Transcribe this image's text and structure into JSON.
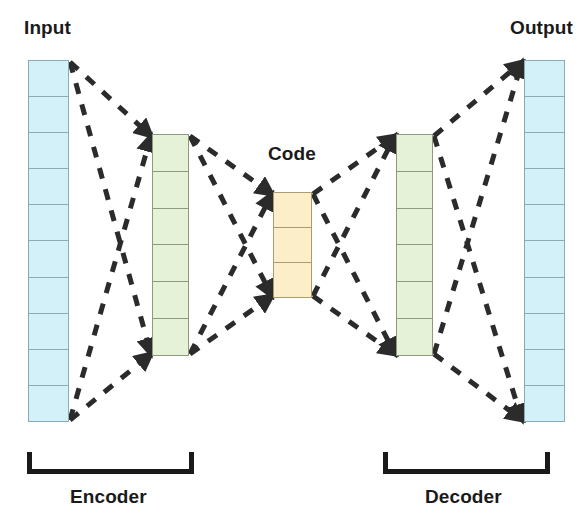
{
  "diagram": {
    "title_alt": "Autoencoder architecture",
    "background_color": "#ffffff"
  },
  "labels": {
    "input": "Input",
    "output": "Output",
    "code": "Code",
    "encoder": "Encoder",
    "decoder": "Decoder"
  },
  "colors": {
    "input_fill": "#d3f1f9",
    "output_fill": "#d3f1f9",
    "hidden_fill": "#e5f2d8",
    "code_fill": "#fbeec9",
    "cell_stroke": "#8f9a9c",
    "connection_stroke": "#2b2b2b",
    "bracket_stroke": "#1a1a1a",
    "text": "#1a1a1a"
  },
  "layers": [
    {
      "id": "input",
      "name": "Input",
      "units": 10,
      "fill": "#d3f1f9",
      "x": 28,
      "y": 60,
      "width": 41,
      "height": 362
    },
    {
      "id": "encoder-hidden",
      "name": "Encoder hidden layer",
      "units": 6,
      "fill": "#e5f2d8",
      "x": 152,
      "y": 134,
      "width": 37,
      "height": 222
    },
    {
      "id": "code",
      "name": "Code",
      "units": 3,
      "fill": "#fbeec9",
      "x": 273,
      "y": 192,
      "width": 39,
      "height": 106
    },
    {
      "id": "decoder-hidden",
      "name": "Decoder hidden layer",
      "units": 6,
      "fill": "#e5f2d8",
      "x": 396,
      "y": 134,
      "width": 37,
      "height": 222
    },
    {
      "id": "output",
      "name": "Output",
      "units": 10,
      "fill": "#d3f1f9",
      "x": 524,
      "y": 60,
      "width": 41,
      "height": 362
    }
  ],
  "connections": {
    "style": "dashed-arrow",
    "dash_pattern": "11 11",
    "stroke_width": 5,
    "edges": [
      {
        "from": "input-top",
        "to": "encoder-top",
        "x1": 70,
        "y1": 62,
        "x2": 151,
        "y2": 136
      },
      {
        "from": "input-top",
        "to": "encoder-bottom",
        "x1": 70,
        "y1": 62,
        "x2": 151,
        "y2": 354
      },
      {
        "from": "input-bottom",
        "to": "encoder-top",
        "x1": 70,
        "y1": 420,
        "x2": 151,
        "y2": 136
      },
      {
        "from": "input-bottom",
        "to": "encoder-bottom",
        "x1": 70,
        "y1": 420,
        "x2": 151,
        "y2": 354
      },
      {
        "from": "encoder-top",
        "to": "code-top",
        "x1": 190,
        "y1": 136,
        "x2": 272,
        "y2": 194
      },
      {
        "from": "encoder-top",
        "to": "code-bottom",
        "x1": 190,
        "y1": 136,
        "x2": 272,
        "y2": 296
      },
      {
        "from": "encoder-bottom",
        "to": "code-top",
        "x1": 190,
        "y1": 354,
        "x2": 272,
        "y2": 194
      },
      {
        "from": "encoder-bottom",
        "to": "code-bottom",
        "x1": 190,
        "y1": 354,
        "x2": 272,
        "y2": 296
      },
      {
        "from": "code-top",
        "to": "decoder-top",
        "x1": 313,
        "y1": 194,
        "x2": 395,
        "y2": 136
      },
      {
        "from": "code-top",
        "to": "decoder-bottom",
        "x1": 313,
        "y1": 194,
        "x2": 395,
        "y2": 354
      },
      {
        "from": "code-bottom",
        "to": "decoder-top",
        "x1": 313,
        "y1": 296,
        "x2": 395,
        "y2": 136
      },
      {
        "from": "code-bottom",
        "to": "decoder-bottom",
        "x1": 313,
        "y1": 296,
        "x2": 395,
        "y2": 354
      },
      {
        "from": "decoder-top",
        "to": "output-top",
        "x1": 434,
        "y1": 136,
        "x2": 522,
        "y2": 62
      },
      {
        "from": "decoder-top",
        "to": "output-bottom",
        "x1": 434,
        "y1": 136,
        "x2": 522,
        "y2": 420
      },
      {
        "from": "decoder-bottom",
        "to": "output-top",
        "x1": 434,
        "y1": 354,
        "x2": 522,
        "y2": 62
      },
      {
        "from": "decoder-bottom",
        "to": "output-bottom",
        "x1": 434,
        "y1": 354,
        "x2": 522,
        "y2": 420
      }
    ]
  },
  "brackets": [
    {
      "id": "encoder",
      "label": "Encoder",
      "x": 27,
      "y": 452,
      "width": 167,
      "height": 22
    },
    {
      "id": "decoder",
      "label": "Decoder",
      "x": 383,
      "y": 452,
      "width": 167,
      "height": 22
    }
  ]
}
